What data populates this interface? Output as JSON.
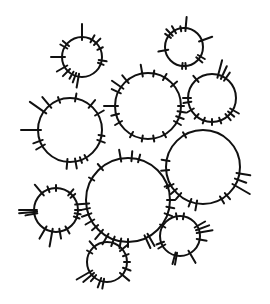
{
  "image": {
    "description": "Hand-drawn black ink circles with radial tick marks on white background",
    "background": "#ffffff",
    "ink": "#111111",
    "circles": [
      {
        "id": "c1",
        "cx": 82,
        "cy": 57,
        "r": 20,
        "ticks": [
          [
            -90,
            16
          ],
          [
            -60,
            8
          ],
          [
            -45,
            9
          ],
          [
            -25,
            6
          ],
          [
            10,
            8
          ],
          [
            20,
            6
          ],
          [
            100,
            14
          ],
          [
            110,
            10
          ],
          [
            120,
            8
          ],
          [
            135,
            10
          ],
          [
            150,
            12
          ],
          [
            180,
            14
          ],
          [
            -150,
            8
          ],
          [
            -140,
            8
          ]
        ]
      },
      {
        "id": "c2",
        "cx": 184,
        "cy": 47,
        "r": 19,
        "ticks": [
          [
            -85,
            14
          ],
          [
            -120,
            8
          ],
          [
            -135,
            9
          ],
          [
            -145,
            7
          ],
          [
            -20,
            14
          ],
          [
            30,
            8
          ],
          [
            40,
            8
          ],
          [
            85,
            6
          ],
          [
            95,
            6
          ],
          [
            170,
            10
          ],
          [
            -100,
            5
          ]
        ]
      },
      {
        "id": "c3",
        "cx": 148,
        "cy": 106,
        "r": 33,
        "ticks": [
          [
            -100,
            12
          ],
          [
            -80,
            6
          ],
          [
            -60,
            7
          ],
          [
            -40,
            8
          ],
          [
            -130,
            10
          ],
          [
            -145,
            14
          ],
          [
            -155,
            10
          ],
          [
            180,
            14
          ],
          [
            165,
            8
          ],
          [
            150,
            8
          ],
          [
            120,
            6
          ],
          [
            100,
            6
          ],
          [
            80,
            6
          ],
          [
            60,
            6
          ],
          [
            30,
            8
          ],
          [
            20,
            8
          ],
          [
            10,
            8
          ],
          [
            0,
            6
          ]
        ]
      },
      {
        "id": "c4",
        "cx": 212,
        "cy": 98,
        "r": 24,
        "ticks": [
          [
            -75,
            18
          ],
          [
            -65,
            14
          ],
          [
            -55,
            10
          ],
          [
            -130,
            8
          ],
          [
            180,
            8
          ],
          [
            170,
            8
          ],
          [
            150,
            8
          ],
          [
            130,
            6
          ],
          [
            110,
            6
          ],
          [
            90,
            6
          ],
          [
            70,
            6
          ],
          [
            50,
            8
          ],
          [
            40,
            8
          ],
          [
            30,
            10
          ]
        ]
      },
      {
        "id": "c5",
        "cx": 70,
        "cy": 130,
        "r": 32,
        "ticks": [
          [
            -110,
            6
          ],
          [
            -130,
            14
          ],
          [
            -145,
            20
          ],
          [
            180,
            20
          ],
          [
            160,
            10
          ],
          [
            150,
            10
          ],
          [
            -80,
            8
          ],
          [
            -50,
            10
          ],
          [
            -30,
            10
          ],
          [
            10,
            6
          ],
          [
            20,
            8
          ],
          [
            60,
            6
          ],
          [
            70,
            6
          ],
          [
            80,
            10
          ],
          [
            95,
            10
          ]
        ]
      },
      {
        "id": "c6",
        "cx": 128,
        "cy": 200,
        "r": 42,
        "ticks": [
          [
            -100,
            12
          ],
          [
            -85,
            10
          ],
          [
            -75,
            8
          ],
          [
            -130,
            8
          ],
          [
            -150,
            6
          ],
          [
            175,
            14
          ],
          [
            168,
            12
          ],
          [
            160,
            10
          ],
          [
            150,
            10
          ],
          [
            140,
            8
          ],
          [
            130,
            12
          ],
          [
            120,
            12
          ],
          [
            110,
            10
          ],
          [
            100,
            10
          ],
          [
            90,
            8
          ],
          [
            65,
            14
          ],
          [
            60,
            14
          ],
          [
            20,
            8
          ],
          [
            10,
            8
          ],
          [
            0,
            8
          ],
          [
            -20,
            6
          ]
        ]
      },
      {
        "id": "c7",
        "cx": 203,
        "cy": 167,
        "r": 37,
        "ticks": [
          [
            -120,
            6
          ],
          [
            10,
            14
          ],
          [
            20,
            12
          ],
          [
            30,
            20
          ],
          [
            50,
            8
          ],
          [
            60,
            8
          ],
          [
            100,
            10
          ],
          [
            110,
            8
          ],
          [
            130,
            8
          ],
          [
            140,
            8
          ],
          [
            150,
            8
          ],
          [
            175,
            8
          ],
          [
            -170,
            8
          ]
        ]
      },
      {
        "id": "c8",
        "cx": 56,
        "cy": 210,
        "r": 22,
        "ticks": [
          [
            -130,
            14
          ],
          [
            -110,
            6
          ],
          [
            -90,
            6
          ],
          [
            -50,
            8
          ],
          [
            -40,
            6
          ],
          [
            180,
            18
          ],
          [
            175,
            18
          ],
          [
            170,
            12
          ],
          [
            120,
            14
          ],
          [
            100,
            18
          ],
          [
            80,
            10
          ],
          [
            60,
            8
          ],
          [
            20,
            6
          ],
          [
            10,
            6
          ],
          [
            0,
            6
          ]
        ]
      },
      {
        "id": "c9",
        "cx": 180,
        "cy": 236,
        "r": 20,
        "ticks": [
          [
            -100,
            6
          ],
          [
            -80,
            6
          ],
          [
            -30,
            12
          ],
          [
            -20,
            14
          ],
          [
            -10,
            16
          ],
          [
            10,
            10
          ],
          [
            60,
            14
          ],
          [
            100,
            12
          ],
          [
            105,
            12
          ],
          [
            150,
            8
          ],
          [
            160,
            8
          ],
          [
            -150,
            6
          ]
        ]
      },
      {
        "id": "c10",
        "cx": 107,
        "cy": 262,
        "r": 20,
        "ticks": [
          [
            -130,
            10
          ],
          [
            -40,
            10
          ],
          [
            -20,
            6
          ],
          [
            0,
            6
          ],
          [
            20,
            8
          ],
          [
            40,
            12
          ],
          [
            130,
            8
          ],
          [
            140,
            14
          ],
          [
            150,
            18
          ],
          [
            100,
            10
          ],
          [
            110,
            10
          ],
          [
            -150,
            6
          ]
        ]
      }
    ]
  }
}
